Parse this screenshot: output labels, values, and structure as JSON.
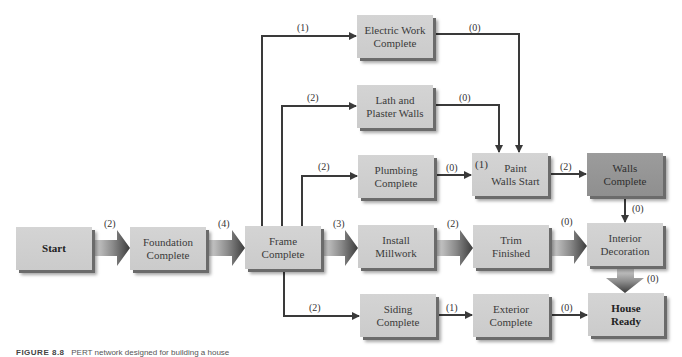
{
  "figure": {
    "caption_label": "FIGURE 8.8",
    "caption_text": "PERT network designed for building a house"
  },
  "nodes": {
    "start": {
      "label": "Start"
    },
    "foundation": {
      "label": "Foundation\nComplete"
    },
    "frame": {
      "label": "Frame\nComplete"
    },
    "electric": {
      "label": "Electric Work\nComplete"
    },
    "lath": {
      "label": "Lath and\nPlaster Walls"
    },
    "plumbing": {
      "label": "Plumbing\nComplete"
    },
    "paint": {
      "label": "Paint\nWalls Start",
      "prefix": "(1)"
    },
    "walls": {
      "label": "Walls\nComplete"
    },
    "millwork": {
      "label": "Install\nMillwork"
    },
    "trim": {
      "label": "Trim\nFinished"
    },
    "interior": {
      "label": "Interior\nDecoration"
    },
    "siding": {
      "label": "Siding\nComplete"
    },
    "exterior": {
      "label": "Exterior\nComplete"
    },
    "house": {
      "label": "House\nReady"
    }
  },
  "edges": {
    "start_foundation": "(2)",
    "foundation_frame": "(4)",
    "frame_electric": "(1)",
    "frame_lath": "(2)",
    "frame_plumbing": "(2)",
    "frame_millwork": "(3)",
    "frame_siding": "(2)",
    "electric_paint": "(0)",
    "lath_paint": "(0)",
    "plumbing_paint": "(0)",
    "paint_walls": "(2)",
    "walls_interior": "(0)",
    "millwork_trim": "(2)",
    "trim_interior": "(0)",
    "interior_house": "(0)",
    "siding_exterior": "(1)",
    "exterior_house": "(0)"
  },
  "colors": {
    "node_fill": "#cfcfcf",
    "node_dark_fill": "#969696",
    "line": "#3a3a3a"
  }
}
